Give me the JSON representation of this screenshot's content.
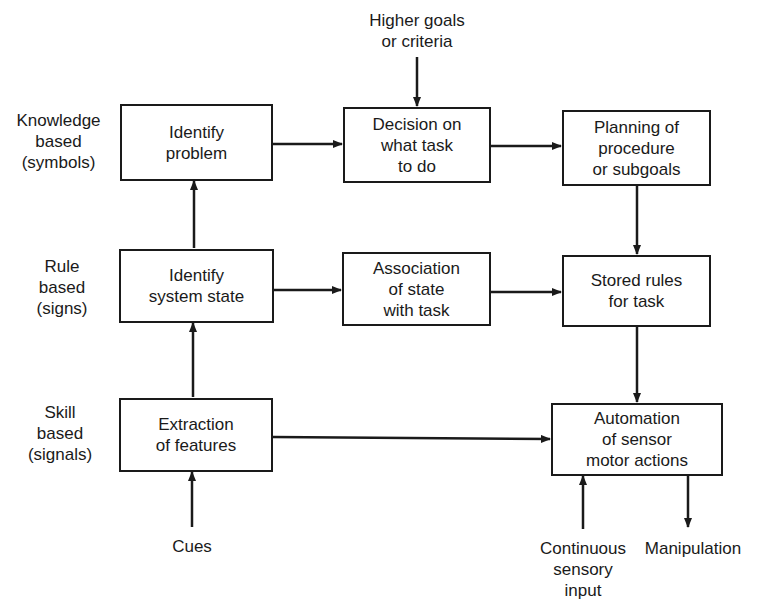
{
  "diagram": {
    "type": "flowchart",
    "levels": [
      {
        "id": "knowledge",
        "label": "Knowledge\nbased\n(symbols)"
      },
      {
        "id": "rule",
        "label": "Rule\nbased\n(signs)"
      },
      {
        "id": "skill",
        "label": "Skill\nbased\n(signals)"
      }
    ],
    "nodes": {
      "identify_problem": "Identify\nproblem",
      "decision": "Decision on\nwhat task\nto do",
      "planning": "Planning of\nprocedure\nor subgoals",
      "identify_state": "Identify\nsystem state",
      "association": "Association\nof state\nwith task",
      "stored_rules": "Stored rules\nfor task",
      "extraction": "Extraction\nof features",
      "automation": "Automation\nof sensor\nmotor actions"
    },
    "external": {
      "higher_goals": "Higher goals\nor criteria",
      "cues": "Cues",
      "continuous_input": "Continuous\nsensory\ninput",
      "manipulation": "Manipulation"
    },
    "edges": [
      {
        "from": "higher_goals",
        "to": "decision"
      },
      {
        "from": "identify_problem",
        "to": "decision"
      },
      {
        "from": "decision",
        "to": "planning"
      },
      {
        "from": "planning",
        "to": "stored_rules"
      },
      {
        "from": "identify_state",
        "to": "identify_problem"
      },
      {
        "from": "identify_state",
        "to": "association"
      },
      {
        "from": "association",
        "to": "stored_rules"
      },
      {
        "from": "stored_rules",
        "to": "automation"
      },
      {
        "from": "extraction",
        "to": "identify_state"
      },
      {
        "from": "extraction",
        "to": "automation"
      },
      {
        "from": "cues",
        "to": "extraction"
      },
      {
        "from": "continuous_input",
        "to": "automation"
      },
      {
        "from": "automation",
        "to": "manipulation"
      }
    ]
  }
}
